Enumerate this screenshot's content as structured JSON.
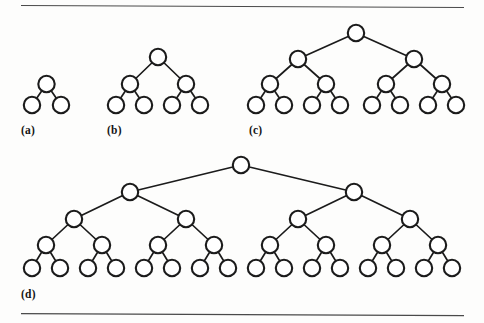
{
  "figure": {
    "background_color": "#fdfdfc",
    "node_fill": "#ffffff",
    "node_stroke": "#1b1b1b",
    "edge_color": "#1b1b1b",
    "rule_color": "#4a4a4a",
    "label_color": "#141414",
    "node_radius": 8.2
  },
  "rules": [
    {
      "name": "top-rule",
      "x1": 21,
      "y1": 5.5,
      "x2": 464,
      "y2": 7.5
    },
    {
      "name": "bottom-rule",
      "x1": 21,
      "y1": 313.5,
      "x2": 464,
      "y2": 315.5
    }
  ],
  "panels": [
    {
      "id": "a",
      "label": "(a)",
      "label_x": 21,
      "label_y": 134,
      "depth": 2,
      "node_count": 3,
      "leaf_count": 2,
      "levels": [
        {
          "level": 1,
          "y": 84,
          "xs": [
            46.5
          ]
        },
        {
          "level": 2,
          "y": 105,
          "xs": [
            32,
            61
          ]
        }
      ],
      "edges": [
        {
          "from": [
            46.5,
            84
          ],
          "to": [
            32,
            105
          ]
        },
        {
          "from": [
            46.5,
            84
          ],
          "to": [
            61,
            105
          ]
        }
      ]
    },
    {
      "id": "b",
      "label": "(b)",
      "label_x": 107,
      "label_y": 134,
      "depth": 3,
      "node_count": 7,
      "leaf_count": 4,
      "levels": [
        {
          "level": 1,
          "y": 57,
          "xs": [
            158
          ]
        },
        {
          "level": 2,
          "y": 84,
          "xs": [
            130,
            186
          ]
        },
        {
          "level": 3,
          "y": 105,
          "xs": [
            116,
            144,
            172,
            200
          ]
        }
      ],
      "edges": [
        {
          "from": [
            158,
            57
          ],
          "to": [
            130,
            84
          ]
        },
        {
          "from": [
            158,
            57
          ],
          "to": [
            186,
            84
          ]
        },
        {
          "from": [
            130,
            84
          ],
          "to": [
            116,
            105
          ]
        },
        {
          "from": [
            130,
            84
          ],
          "to": [
            144,
            105
          ]
        },
        {
          "from": [
            186,
            84
          ],
          "to": [
            172,
            105
          ]
        },
        {
          "from": [
            186,
            84
          ],
          "to": [
            200,
            105
          ]
        }
      ]
    },
    {
      "id": "c",
      "label": "(c)",
      "label_x": 249,
      "label_y": 134,
      "depth": 4,
      "node_count": 15,
      "leaf_count": 8,
      "levels": [
        {
          "level": 1,
          "y": 33,
          "xs": [
            356
          ]
        },
        {
          "level": 2,
          "y": 59,
          "xs": [
            298,
            414
          ]
        },
        {
          "level": 3,
          "y": 84,
          "xs": [
            270,
            326,
            386,
            442
          ]
        },
        {
          "level": 4,
          "y": 105,
          "xs": [
            256,
            284,
            312,
            340,
            372,
            400,
            428,
            456
          ]
        }
      ],
      "edges": [
        {
          "from": [
            356,
            33
          ],
          "to": [
            298,
            59
          ]
        },
        {
          "from": [
            356,
            33
          ],
          "to": [
            414,
            59
          ]
        },
        {
          "from": [
            298,
            59
          ],
          "to": [
            270,
            84
          ]
        },
        {
          "from": [
            298,
            59
          ],
          "to": [
            326,
            84
          ]
        },
        {
          "from": [
            414,
            59
          ],
          "to": [
            386,
            84
          ]
        },
        {
          "from": [
            414,
            59
          ],
          "to": [
            442,
            84
          ]
        },
        {
          "from": [
            270,
            84
          ],
          "to": [
            256,
            105
          ]
        },
        {
          "from": [
            270,
            84
          ],
          "to": [
            284,
            105
          ]
        },
        {
          "from": [
            326,
            84
          ],
          "to": [
            312,
            105
          ]
        },
        {
          "from": [
            326,
            84
          ],
          "to": [
            340,
            105
          ]
        },
        {
          "from": [
            386,
            84
          ],
          "to": [
            372,
            105
          ]
        },
        {
          "from": [
            386,
            84
          ],
          "to": [
            400,
            105
          ]
        },
        {
          "from": [
            442,
            84
          ],
          "to": [
            428,
            105
          ]
        },
        {
          "from": [
            442,
            84
          ],
          "to": [
            456,
            105
          ]
        }
      ]
    },
    {
      "id": "d",
      "label": "(d)",
      "label_x": 21,
      "label_y": 298,
      "depth": 5,
      "node_count": 31,
      "leaf_count": 16,
      "levels": [
        {
          "level": 1,
          "y": 165,
          "xs": [
            241
          ]
        },
        {
          "level": 2,
          "y": 192,
          "xs": [
            130,
            354
          ]
        },
        {
          "level": 3,
          "y": 219,
          "xs": [
            74,
            186,
            298,
            410
          ]
        },
        {
          "level": 4,
          "y": 245,
          "xs": [
            46,
            102,
            158,
            214,
            270,
            326,
            382,
            438
          ]
        },
        {
          "level": 5,
          "y": 268,
          "xs": [
            32,
            60,
            88,
            116,
            144,
            172,
            200,
            228,
            256,
            284,
            312,
            340,
            368,
            396,
            424,
            452
          ]
        }
      ],
      "edges": [
        {
          "from": [
            241,
            165
          ],
          "to": [
            130,
            192
          ]
        },
        {
          "from": [
            241,
            165
          ],
          "to": [
            354,
            192
          ]
        },
        {
          "from": [
            130,
            192
          ],
          "to": [
            74,
            219
          ]
        },
        {
          "from": [
            130,
            192
          ],
          "to": [
            186,
            219
          ]
        },
        {
          "from": [
            354,
            192
          ],
          "to": [
            298,
            219
          ]
        },
        {
          "from": [
            354,
            192
          ],
          "to": [
            410,
            219
          ]
        },
        {
          "from": [
            74,
            219
          ],
          "to": [
            46,
            245
          ]
        },
        {
          "from": [
            74,
            219
          ],
          "to": [
            102,
            245
          ]
        },
        {
          "from": [
            186,
            219
          ],
          "to": [
            158,
            245
          ]
        },
        {
          "from": [
            186,
            219
          ],
          "to": [
            214,
            245
          ]
        },
        {
          "from": [
            298,
            219
          ],
          "to": [
            270,
            245
          ]
        },
        {
          "from": [
            298,
            219
          ],
          "to": [
            326,
            245
          ]
        },
        {
          "from": [
            410,
            219
          ],
          "to": [
            382,
            245
          ]
        },
        {
          "from": [
            410,
            219
          ],
          "to": [
            438,
            245
          ]
        },
        {
          "from": [
            46,
            245
          ],
          "to": [
            32,
            268
          ]
        },
        {
          "from": [
            46,
            245
          ],
          "to": [
            60,
            268
          ]
        },
        {
          "from": [
            102,
            245
          ],
          "to": [
            88,
            268
          ]
        },
        {
          "from": [
            102,
            245
          ],
          "to": [
            116,
            268
          ]
        },
        {
          "from": [
            158,
            245
          ],
          "to": [
            144,
            268
          ]
        },
        {
          "from": [
            158,
            245
          ],
          "to": [
            172,
            268
          ]
        },
        {
          "from": [
            214,
            245
          ],
          "to": [
            200,
            268
          ]
        },
        {
          "from": [
            214,
            245
          ],
          "to": [
            228,
            268
          ]
        },
        {
          "from": [
            270,
            245
          ],
          "to": [
            256,
            268
          ]
        },
        {
          "from": [
            270,
            245
          ],
          "to": [
            284,
            268
          ]
        },
        {
          "from": [
            326,
            245
          ],
          "to": [
            312,
            268
          ]
        },
        {
          "from": [
            326,
            245
          ],
          "to": [
            340,
            268
          ]
        },
        {
          "from": [
            382,
            245
          ],
          "to": [
            368,
            268
          ]
        },
        {
          "from": [
            382,
            245
          ],
          "to": [
            396,
            268
          ]
        },
        {
          "from": [
            438,
            245
          ],
          "to": [
            424,
            268
          ]
        },
        {
          "from": [
            438,
            245
          ],
          "to": [
            452,
            268
          ]
        }
      ]
    }
  ]
}
